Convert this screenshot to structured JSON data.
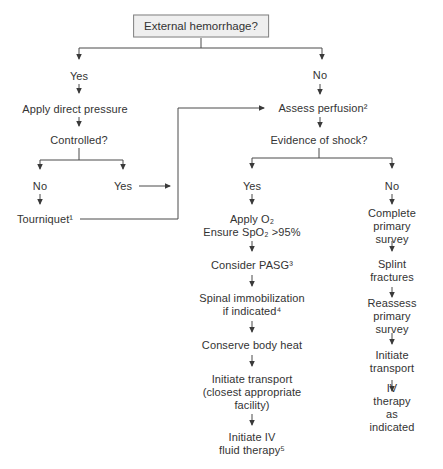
{
  "figure": {
    "type": "flowchart",
    "colors": {
      "line": "#4a4a4a",
      "arrowhead": "#3a3a3a",
      "text": "#333333",
      "box_fill": "#efefef",
      "box_border": "#808080",
      "background": "#ffffff"
    },
    "nodes": {
      "external_hemorrhage": "External hemorrhage?",
      "yes_hemorrhage": "Yes",
      "no_hemorrhage": "No",
      "apply_direct_pressure": "Apply direct pressure",
      "controlled": "Controlled?",
      "no_controlled": "No",
      "yes_controlled": "Yes",
      "tourniquet": "Tourniquet¹",
      "assess_perfusion": "Assess perfusion²",
      "evidence_of_shock": "Evidence of shock?",
      "yes_shock": "Yes",
      "no_shock": "No",
      "apply_o2": "Apply O₂\nEnsure SpO₂ >95%",
      "consider_pasg": "Consider PASG³",
      "spinal_immobilization": "Spinal immobilization\nif indicated⁴",
      "conserve_body_heat": "Conserve body heat",
      "initiate_transport_facility": "Initiate transport\n(closest appropriate\nfacility)",
      "initiate_iv_fluid_therapy": "Initiate IV\nfluid therapy⁵",
      "complete_primary_survey": "Complete\nprimary survey",
      "splint_fractures": "Splint\nfractures",
      "reassess_primary_survey": "Reassess\nprimary survey",
      "initiate_transport": "Initiate\ntransport",
      "iv_therapy_as_indicated": "IV therapy\nas indicated"
    }
  }
}
